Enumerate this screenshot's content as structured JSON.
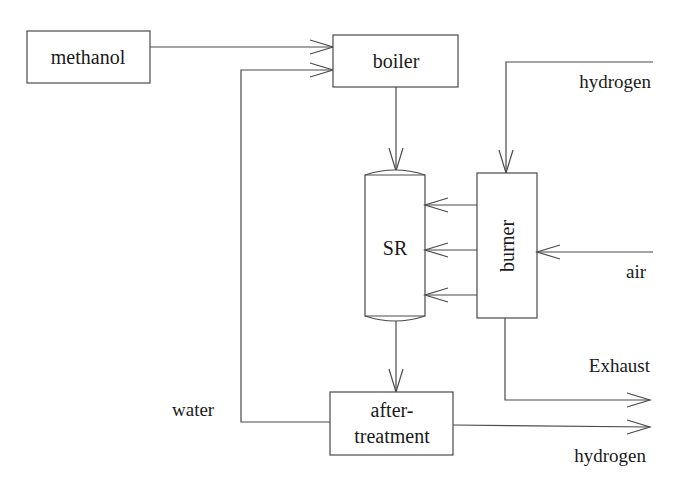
{
  "diagram": {
    "type": "process-flow",
    "nodes": {
      "methanol": {
        "label": "methanol"
      },
      "boiler": {
        "label": "boiler"
      },
      "sr": {
        "label": "SR"
      },
      "burner": {
        "label": "burner"
      },
      "aftertreatment": {
        "label_line1": "after-",
        "label_line2": "treatment"
      }
    },
    "streams": {
      "hydrogen_in": {
        "label": "hydrogen"
      },
      "air": {
        "label": "air"
      },
      "exhaust": {
        "label": "Exhaust"
      },
      "water": {
        "label": "water"
      },
      "hydrogen_out": {
        "label": "hydrogen"
      }
    },
    "edges": [
      {
        "from": "methanol",
        "to": "boiler"
      },
      {
        "from": "water",
        "to": "boiler"
      },
      {
        "from": "boiler",
        "to": "SR"
      },
      {
        "from": "hydrogen_in",
        "to": "burner"
      },
      {
        "from": "air",
        "to": "burner"
      },
      {
        "from": "burner",
        "to": "SR",
        "count": 3
      },
      {
        "from": "burner",
        "to": "exhaust"
      },
      {
        "from": "SR",
        "to": "aftertreatment"
      },
      {
        "from": "aftertreatment",
        "to": "water"
      },
      {
        "from": "aftertreatment",
        "to": "hydrogen_out"
      }
    ]
  }
}
